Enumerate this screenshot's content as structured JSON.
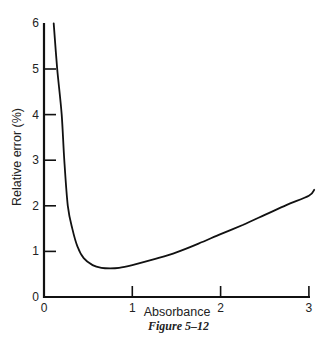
{
  "chart_data": {
    "type": "line",
    "title": "",
    "caption": "Figure 5–12",
    "xlabel": "Absorbance",
    "ylabel": "Relative error (%)",
    "xlim": [
      0,
      3.1
    ],
    "ylim": [
      0,
      6
    ],
    "x_ticks": [
      0,
      1,
      2,
      3
    ],
    "x_tick_labels": [
      "0",
      "1",
      "2",
      "3"
    ],
    "y_ticks": [
      0,
      1,
      2,
      3,
      4,
      5,
      6
    ],
    "y_tick_labels": [
      "0",
      "1",
      "2",
      "3",
      "4",
      "5",
      "6"
    ],
    "grid": false,
    "legend": null,
    "series": [
      {
        "name": "Relative error",
        "x": [
          0.11,
          0.15,
          0.2,
          0.23,
          0.27,
          0.32,
          0.38,
          0.45,
          0.55,
          0.65,
          0.75,
          0.85,
          1.0,
          1.25,
          1.5,
          1.75,
          2.0,
          2.25,
          2.5,
          2.75,
          3.0,
          3.06
        ],
        "y": [
          6.0,
          5.0,
          4.0,
          3.0,
          2.0,
          1.5,
          1.1,
          0.85,
          0.7,
          0.64,
          0.63,
          0.64,
          0.7,
          0.83,
          0.98,
          1.17,
          1.38,
          1.58,
          1.8,
          2.02,
          2.22,
          2.35
        ]
      }
    ]
  }
}
